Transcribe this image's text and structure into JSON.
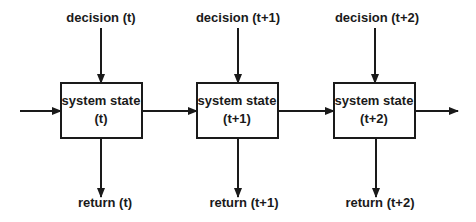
{
  "diagram": {
    "stages": [
      {
        "decision": "decision (t)",
        "state_line1": "system state",
        "state_line2": "(t)",
        "return": "return (t)"
      },
      {
        "decision": "decision (t+1)",
        "state_line1": "system state",
        "state_line2": "(t+1)",
        "return": "return (t+1)"
      },
      {
        "decision": "decision (t+2)",
        "state_line1": "system state",
        "state_line2": "(t+2)",
        "return": "return (t+2)"
      }
    ],
    "colors": {
      "stroke": "#1a1a1a",
      "background": "#ffffff"
    }
  }
}
